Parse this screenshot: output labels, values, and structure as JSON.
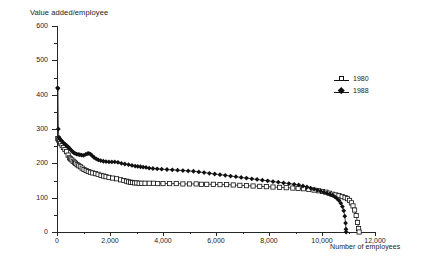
{
  "chart_data": {
    "type": "line",
    "title": "Value added/employee",
    "ylabel": "Value added/employee",
    "xlabel": "Number of employees",
    "xlim": [
      0,
      12000
    ],
    "ylim": [
      0,
      600
    ],
    "xticks": [
      0,
      2000,
      4000,
      6000,
      8000,
      10000,
      12000
    ],
    "xtick_labels": [
      "0",
      "2,000",
      "4,000",
      "6,000",
      "8,000",
      "10,000",
      "12,000"
    ],
    "xminor_ticks": [
      1000,
      3000,
      5000,
      7000,
      9000,
      11000
    ],
    "yticks": [
      0,
      100,
      200,
      300,
      400,
      500,
      600
    ],
    "ytick_labels": [
      "0",
      "100",
      "200",
      "300",
      "400",
      "500",
      "600"
    ],
    "yminor_ticks": [
      50,
      150,
      250,
      350,
      450,
      550
    ],
    "grid": false,
    "legend_position": "upper right",
    "series": [
      {
        "name": "1980",
        "marker": "open-square",
        "points": [
          [
            30,
            272
          ],
          [
            60,
            268
          ],
          [
            95,
            263
          ],
          [
            140,
            258
          ],
          [
            190,
            252
          ],
          [
            240,
            246
          ],
          [
            300,
            240
          ],
          [
            360,
            234
          ],
          [
            420,
            224
          ],
          [
            470,
            216
          ],
          [
            510,
            213
          ],
          [
            560,
            210
          ],
          [
            610,
            206
          ],
          [
            660,
            203
          ],
          [
            700,
            200
          ],
          [
            760,
            196
          ],
          [
            820,
            193
          ],
          [
            880,
            190
          ],
          [
            950,
            186
          ],
          [
            1020,
            182
          ],
          [
            1100,
            179
          ],
          [
            1180,
            176
          ],
          [
            1260,
            174
          ],
          [
            1350,
            172
          ],
          [
            1450,
            170
          ],
          [
            1550,
            168
          ],
          [
            1660,
            165
          ],
          [
            1760,
            163
          ],
          [
            1850,
            161
          ],
          [
            1960,
            159
          ],
          [
            2100,
            157
          ],
          [
            2250,
            155
          ],
          [
            2400,
            152
          ],
          [
            2520,
            150
          ],
          [
            2620,
            148
          ],
          [
            2700,
            146
          ],
          [
            2780,
            145
          ],
          [
            2850,
            144
          ],
          [
            2930,
            143
          ],
          [
            3010,
            143
          ],
          [
            3100,
            142
          ],
          [
            3200,
            142
          ],
          [
            3320,
            142
          ],
          [
            3480,
            142
          ],
          [
            3640,
            142
          ],
          [
            3800,
            141
          ],
          [
            4000,
            141
          ],
          [
            4250,
            141
          ],
          [
            4500,
            141
          ],
          [
            4750,
            140
          ],
          [
            5000,
            140
          ],
          [
            5250,
            140
          ],
          [
            5450,
            139
          ],
          [
            5650,
            139
          ],
          [
            5900,
            139
          ],
          [
            6150,
            138
          ],
          [
            6400,
            138
          ],
          [
            6650,
            137
          ],
          [
            6900,
            136
          ],
          [
            7150,
            135
          ],
          [
            7400,
            134
          ],
          [
            7650,
            133
          ],
          [
            7900,
            132
          ],
          [
            8150,
            131
          ],
          [
            8400,
            130
          ],
          [
            8650,
            129
          ],
          [
            8900,
            128
          ],
          [
            9100,
            127
          ],
          [
            9300,
            126
          ],
          [
            9500,
            124
          ],
          [
            9700,
            122
          ],
          [
            9880,
            120
          ],
          [
            10020,
            118
          ],
          [
            10150,
            116
          ],
          [
            10280,
            113
          ],
          [
            10400,
            110
          ],
          [
            10520,
            108
          ],
          [
            10640,
            106
          ],
          [
            10760,
            103
          ],
          [
            10870,
            100
          ],
          [
            10960,
            97
          ],
          [
            11040,
            92
          ],
          [
            11110,
            85
          ],
          [
            11170,
            76
          ],
          [
            11230,
            64
          ],
          [
            11290,
            48
          ],
          [
            11340,
            28
          ],
          [
            11380,
            10
          ],
          [
            11400,
            0
          ]
        ]
      },
      {
        "name": "1988",
        "marker": "filled-diamond",
        "points": [
          [
            20,
            420
          ],
          [
            35,
            418
          ],
          [
            50,
            300
          ],
          [
            70,
            276
          ],
          [
            100,
            272
          ],
          [
            140,
            268
          ],
          [
            190,
            264
          ],
          [
            240,
            260
          ],
          [
            300,
            256
          ],
          [
            360,
            252
          ],
          [
            420,
            248
          ],
          [
            480,
            243
          ],
          [
            540,
            238
          ],
          [
            590,
            234
          ],
          [
            630,
            231
          ],
          [
            680,
            229
          ],
          [
            740,
            227
          ],
          [
            800,
            226
          ],
          [
            860,
            225
          ],
          [
            930,
            224
          ],
          [
            1000,
            223
          ],
          [
            1080,
            226
          ],
          [
            1150,
            228
          ],
          [
            1200,
            229
          ],
          [
            1260,
            227
          ],
          [
            1330,
            222
          ],
          [
            1400,
            217
          ],
          [
            1480,
            213
          ],
          [
            1560,
            210
          ],
          [
            1650,
            208
          ],
          [
            1750,
            206
          ],
          [
            1850,
            205
          ],
          [
            1960,
            204
          ],
          [
            2070,
            204
          ],
          [
            2180,
            204
          ],
          [
            2300,
            203
          ],
          [
            2430,
            200
          ],
          [
            2560,
            198
          ],
          [
            2700,
            196
          ],
          [
            2830,
            194
          ],
          [
            2950,
            192
          ],
          [
            3050,
            191
          ],
          [
            3150,
            190
          ],
          [
            3250,
            189
          ],
          [
            3360,
            188
          ],
          [
            3480,
            186
          ],
          [
            3620,
            185
          ],
          [
            3780,
            184
          ],
          [
            3950,
            183
          ],
          [
            4150,
            182
          ],
          [
            4350,
            181
          ],
          [
            4550,
            180
          ],
          [
            4750,
            179
          ],
          [
            4950,
            178
          ],
          [
            5150,
            177
          ],
          [
            5350,
            175
          ],
          [
            5550,
            173
          ],
          [
            5750,
            171
          ],
          [
            5950,
            169
          ],
          [
            6150,
            167
          ],
          [
            6350,
            165
          ],
          [
            6550,
            163
          ],
          [
            6750,
            161
          ],
          [
            6950,
            159
          ],
          [
            7150,
            157
          ],
          [
            7350,
            155
          ],
          [
            7550,
            153
          ],
          [
            7750,
            151
          ],
          [
            7950,
            149
          ],
          [
            8150,
            147
          ],
          [
            8350,
            145
          ],
          [
            8550,
            143
          ],
          [
            8750,
            141
          ],
          [
            8950,
            139
          ],
          [
            9120,
            137
          ],
          [
            9280,
            134
          ],
          [
            9430,
            131
          ],
          [
            9570,
            128
          ],
          [
            9700,
            125
          ],
          [
            9830,
            122
          ],
          [
            9950,
            119
          ],
          [
            10070,
            116
          ],
          [
            10180,
            113
          ],
          [
            10290,
            110
          ],
          [
            10390,
            107
          ],
          [
            10480,
            103
          ],
          [
            10560,
            98
          ],
          [
            10640,
            92
          ],
          [
            10710,
            84
          ],
          [
            10770,
            74
          ],
          [
            10820,
            62
          ],
          [
            10860,
            46
          ],
          [
            10890,
            26
          ],
          [
            10905,
            8
          ],
          [
            10910,
            0
          ]
        ]
      }
    ]
  }
}
